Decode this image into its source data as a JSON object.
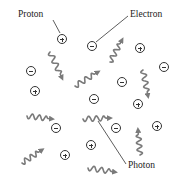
{
  "diagram": {
    "title": "",
    "labels": {
      "proton": "Proton",
      "electron": "Electron",
      "photon": "Photon"
    },
    "colors": {
      "particle_stroke": "#333333",
      "photon": "#7a7a7a",
      "leader_line": "#333333",
      "text": "#222222"
    },
    "protons": [
      {
        "x": 62,
        "y": 39
      },
      {
        "x": 140,
        "y": 48
      },
      {
        "x": 35,
        "y": 91
      },
      {
        "x": 138,
        "y": 104
      },
      {
        "x": 157,
        "y": 126
      },
      {
        "x": 91,
        "y": 145
      },
      {
        "x": 65,
        "y": 155
      }
    ],
    "electrons": [
      {
        "x": 92,
        "y": 46
      },
      {
        "x": 31,
        "y": 71
      },
      {
        "x": 164,
        "y": 67
      },
      {
        "x": 122,
        "y": 82
      },
      {
        "x": 94,
        "y": 99
      },
      {
        "x": 56,
        "y": 128
      },
      {
        "x": 116,
        "y": 128
      }
    ],
    "photons": [
      {
        "x1": 50,
        "y1": 52,
        "x2": 62,
        "y2": 78
      },
      {
        "x1": 110,
        "y1": 62,
        "x2": 122,
        "y2": 40
      },
      {
        "x1": 75,
        "y1": 86,
        "x2": 98,
        "y2": 72
      },
      {
        "x1": 143,
        "y1": 70,
        "x2": 148,
        "y2": 96
      },
      {
        "x1": 27,
        "y1": 116,
        "x2": 52,
        "y2": 119
      },
      {
        "x1": 83,
        "y1": 119,
        "x2": 110,
        "y2": 118
      },
      {
        "x1": 140,
        "y1": 155,
        "x2": 138,
        "y2": 130
      },
      {
        "x1": 22,
        "y1": 163,
        "x2": 42,
        "y2": 150
      },
      {
        "x1": 88,
        "y1": 168,
        "x2": 115,
        "y2": 172
      }
    ],
    "callouts": {
      "proton": {
        "text_x": 18,
        "text_y": 10,
        "line": [
          53,
          20,
          60,
          33
        ]
      },
      "electron": {
        "text_x": 130,
        "text_y": 10,
        "line": [
          128,
          16,
          96,
          42
        ]
      },
      "photon": {
        "text_x": 128,
        "text_y": 161,
        "line": [
          126,
          164,
          98,
          121
        ]
      }
    }
  }
}
